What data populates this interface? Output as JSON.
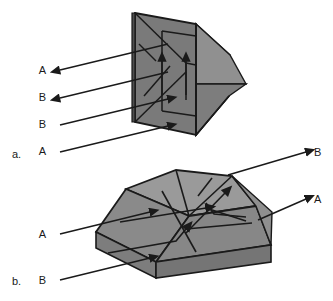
{
  "figure": {
    "background_color": "#ffffff",
    "line_color": "#1a1a1a",
    "colors": {
      "face_light": "#9a9a9a",
      "face_mid": "#8a8a8a",
      "face_dark": "#6f6f6f",
      "face_darkest": "#5e5e5e",
      "outline": "#1a1a1a",
      "text": "#1a1a1a"
    },
    "panels": [
      {
        "id": "a",
        "marker": "a.",
        "marker_x": 12,
        "marker_y": 154,
        "description": "Erecting prism viewed edge-on, four horizontal rays on the left",
        "rays": [
          {
            "label": "A",
            "label_x": 46,
            "label_y": 74,
            "direction": "out-left",
            "y_left": 70,
            "y_right": 44
          },
          {
            "label": "B",
            "label_x": 46,
            "label_y": 101,
            "direction": "out-left",
            "y_left": 98,
            "y_right": 72
          },
          {
            "label": "B",
            "label_x": 46,
            "label_y": 128,
            "direction": "in-right",
            "y_left": 125,
            "y_right": 99
          },
          {
            "label": "A",
            "label_x": 46,
            "label_y": 155,
            "direction": "in-right",
            "y_left": 152,
            "y_right": 126
          }
        ]
      },
      {
        "id": "b",
        "marker": "b.",
        "marker_x": 12,
        "marker_y": 281,
        "description": "Trapezoidal roof prism in three-quarter view, rays entering left and exiting right",
        "rays": [
          {
            "label": "A",
            "label_x": 46,
            "label_y": 236,
            "direction": "in-right",
            "side": "left"
          },
          {
            "label": "B",
            "label_x": 46,
            "label_y": 282,
            "direction": "in-right",
            "side": "left"
          },
          {
            "label": "B",
            "label_x": 314,
            "label_y": 154,
            "direction": "out-right",
            "side": "right"
          },
          {
            "label": "A",
            "label_x": 314,
            "label_y": 200,
            "direction": "out-right",
            "side": "right"
          }
        ]
      }
    ]
  }
}
